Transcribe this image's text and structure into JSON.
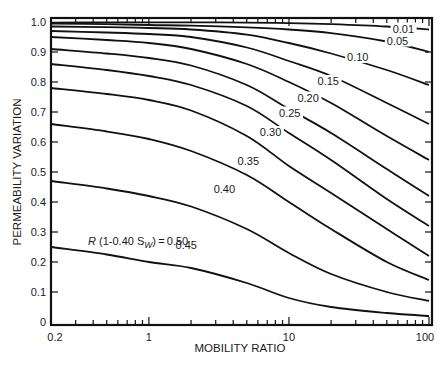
{
  "chart_data": {
    "type": "line",
    "title": "",
    "xlabel": "MOBILITY RATIO",
    "ylabel": "PERMEABILITY VARIATION",
    "xscale": "log",
    "xlim": [
      0.2,
      100
    ],
    "ylim": [
      0,
      1.0
    ],
    "grid": false,
    "legend": "inline curve labels",
    "x_ticks": [
      {
        "value": 0.2,
        "label": "0.2"
      },
      {
        "value": 1,
        "label": "1"
      },
      {
        "value": 10,
        "label": "10"
      },
      {
        "value": 100,
        "label": "100"
      }
    ],
    "y_ticks": [
      {
        "value": 0,
        "label": "0"
      },
      {
        "value": 0.1,
        "label": "0.1"
      },
      {
        "value": 0.2,
        "label": "0.2"
      },
      {
        "value": 0.3,
        "label": "0.3"
      },
      {
        "value": 0.4,
        "label": "0.4"
      },
      {
        "value": 0.5,
        "label": "0.5"
      },
      {
        "value": 0.6,
        "label": "0.6"
      },
      {
        "value": 0.7,
        "label": "0.7"
      },
      {
        "value": 0.8,
        "label": "0.8"
      },
      {
        "value": 0.9,
        "label": "0.9"
      },
      {
        "value": 1.0,
        "label": "1.0"
      }
    ],
    "parameter_label": {
      "prefix": "R",
      "mid": " (1-0.40 S",
      "sub": "W",
      "suffix": ") = 0.50"
    },
    "x": [
      0.2,
      0.5,
      1,
      2,
      5,
      10,
      20,
      50,
      100
    ],
    "series": [
      {
        "name": "0.01",
        "values": [
          0.998,
          0.999,
          0.999,
          0.999,
          0.998,
          0.996,
          0.993,
          0.985,
          0.975
        ]
      },
      {
        "name": "0.05",
        "values": [
          0.995,
          0.993,
          0.99,
          0.988,
          0.982,
          0.975,
          0.963,
          0.935,
          0.9
        ]
      },
      {
        "name": "0.10",
        "values": [
          0.985,
          0.983,
          0.98,
          0.975,
          0.958,
          0.93,
          0.895,
          0.84,
          0.79
        ]
      },
      {
        "name": "0.15",
        "values": [
          0.97,
          0.965,
          0.96,
          0.95,
          0.915,
          0.87,
          0.82,
          0.73,
          0.66
        ]
      },
      {
        "name": "0.20",
        "values": [
          0.95,
          0.94,
          0.93,
          0.91,
          0.86,
          0.8,
          0.73,
          0.62,
          0.54
        ]
      },
      {
        "name": "0.25",
        "values": [
          0.91,
          0.895,
          0.88,
          0.855,
          0.79,
          0.71,
          0.63,
          0.51,
          0.42
        ]
      },
      {
        "name": "0.30",
        "values": [
          0.86,
          0.84,
          0.82,
          0.79,
          0.72,
          0.63,
          0.54,
          0.41,
          0.32
        ]
      },
      {
        "name": "0.35",
        "values": [
          0.78,
          0.76,
          0.74,
          0.705,
          0.62,
          0.52,
          0.43,
          0.31,
          0.22
        ]
      },
      {
        "name": "0.40",
        "values": [
          0.66,
          0.635,
          0.61,
          0.57,
          0.49,
          0.4,
          0.31,
          0.2,
          0.14
        ]
      },
      {
        "name": "0.45",
        "values": [
          0.47,
          0.445,
          0.42,
          0.385,
          0.31,
          0.23,
          0.16,
          0.1,
          0.07
        ]
      },
      {
        "name": "0.50",
        "values": [
          0.25,
          0.225,
          0.2,
          0.18,
          0.13,
          0.08,
          0.05,
          0.03,
          0.02
        ]
      }
    ],
    "label_positions": [
      {
        "series": "0.01",
        "x": 55,
        "y": 0.965
      },
      {
        "series": "0.05",
        "x": 50,
        "y": 0.925
      },
      {
        "series": "0.10",
        "x": 26,
        "y": 0.87
      },
      {
        "series": "0.15",
        "x": 16,
        "y": 0.79
      },
      {
        "series": "0.20",
        "x": 11.5,
        "y": 0.735
      },
      {
        "series": "0.25",
        "x": 8.5,
        "y": 0.685
      },
      {
        "series": "0.30",
        "x": 6.2,
        "y": 0.62
      },
      {
        "series": "0.35",
        "x": 4.3,
        "y": 0.525
      },
      {
        "series": "0.40",
        "x": 2.9,
        "y": 0.43
      },
      {
        "series": "0.45",
        "x": 1.55,
        "y": 0.245
      }
    ]
  },
  "axes": {
    "x_title": "MOBILITY RATIO",
    "y_title": "PERMEABILITY VARIATION"
  }
}
